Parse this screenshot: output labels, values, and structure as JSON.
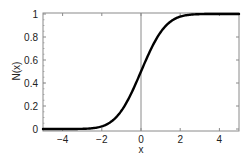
{
  "chart_data": {
    "type": "line",
    "title": "",
    "xlabel": "x",
    "ylabel": "N(x)",
    "xlim": [
      -5,
      5
    ],
    "ylim": [
      0,
      1
    ],
    "grid": false,
    "legend": null,
    "x_ticks": [
      -4,
      -2,
      0,
      2,
      4
    ],
    "x_tick_labels": [
      "−4",
      "−2",
      "0",
      "2",
      "4"
    ],
    "y_ticks": [
      0,
      0.2,
      0.4,
      0.6,
      0.8,
      1
    ],
    "y_tick_labels": [
      "0",
      "0.2",
      "0.4",
      "0.6",
      "0.8",
      "1"
    ],
    "annotations": [
      {
        "type": "vertical_line",
        "x": 0,
        "color": "#8a8a8a"
      }
    ],
    "series": [
      {
        "name": "N(x)",
        "description": "Standard normal cumulative distribution function",
        "color": "#000000",
        "x": [
          -5,
          -4.5,
          -4,
          -3.5,
          -3,
          -2.5,
          -2,
          -1.75,
          -1.5,
          -1.25,
          -1,
          -0.75,
          -0.5,
          -0.25,
          0,
          0.25,
          0.5,
          0.75,
          1,
          1.25,
          1.5,
          1.75,
          2,
          2.5,
          3,
          3.5,
          4,
          4.5,
          5
        ],
        "values": [
          0.0,
          0.0,
          0.0,
          0.0002,
          0.0013,
          0.0062,
          0.0228,
          0.0401,
          0.0668,
          0.1056,
          0.1587,
          0.2266,
          0.3085,
          0.4013,
          0.5,
          0.5987,
          0.6915,
          0.7734,
          0.8413,
          0.8944,
          0.9332,
          0.9599,
          0.9772,
          0.9938,
          0.9987,
          0.9998,
          1.0,
          1.0,
          1.0
        ]
      }
    ]
  },
  "colors": {
    "curve": "#000000",
    "frame": "#8a8a8a",
    "zero_line": "#8a8a8a",
    "text": "#222222",
    "background": "#ffffff"
  }
}
